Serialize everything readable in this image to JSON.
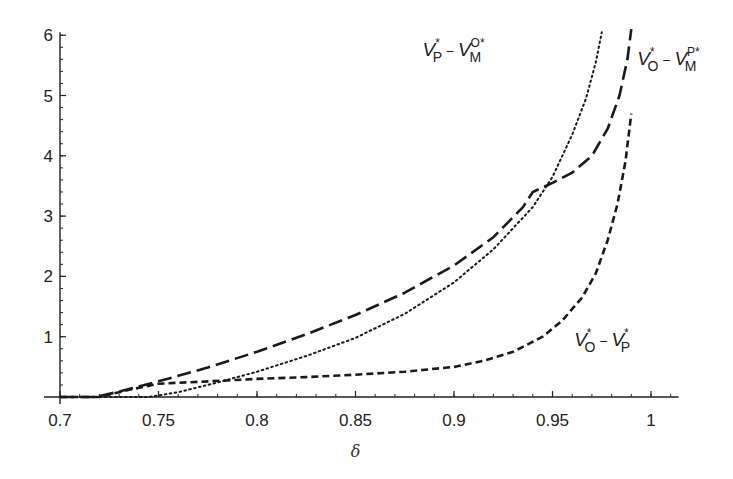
{
  "chart_data": {
    "type": "line",
    "title": "",
    "xlabel": "δ",
    "ylabel": "",
    "xlim": [
      0.7,
      1.014
    ],
    "ylim": [
      0,
      6.05
    ],
    "grid": false,
    "x_ticks": [
      0.7,
      0.75,
      0.8,
      0.85,
      0.9,
      0.95,
      1
    ],
    "x_tick_labels": [
      "0.7",
      "0.75",
      "0.8",
      "0.85",
      "0.9",
      "0.95",
      "1"
    ],
    "y_ticks": [
      1,
      2,
      3,
      4,
      5,
      6
    ],
    "y_tick_labels": [
      "1",
      "2",
      "3",
      "4",
      "5",
      "6"
    ],
    "x_minor_step": 0.01,
    "y_minor_step": 0.2,
    "series": [
      {
        "name": "V_O* − V_M^P*",
        "style": "long-dash",
        "label": {
          "v1": "V",
          "sub1": "O",
          "sup1": "*",
          "minus": "−",
          "v2": "V",
          "sub2": "M",
          "sup2": "P*"
        },
        "label_anchor": [
          0.993,
          5.5
        ],
        "x": [
          0.7,
          0.718,
          0.73,
          0.75,
          0.775,
          0.8,
          0.825,
          0.85,
          0.875,
          0.9,
          0.92,
          0.935,
          0.94,
          0.95,
          0.96,
          0.97,
          0.978,
          0.984,
          0.988,
          0.99
        ],
        "y": [
          0,
          0,
          0.09,
          0.26,
          0.49,
          0.75,
          1.04,
          1.36,
          1.73,
          2.18,
          2.65,
          3.15,
          3.4,
          3.55,
          3.72,
          4.0,
          4.45,
          5.0,
          5.6,
          6.1
        ]
      },
      {
        "name": "V_P* − V_M^O*",
        "style": "dotted",
        "label": {
          "v1": "V",
          "sub1": "P",
          "sup1": "*",
          "minus": "−",
          "v2": "V",
          "sub2": "M",
          "sup2": "O*"
        },
        "label_anchor": [
          0.884,
          5.65
        ],
        "x": [
          0.7,
          0.72,
          0.745,
          0.76,
          0.78,
          0.8,
          0.825,
          0.85,
          0.875,
          0.9,
          0.92,
          0.94,
          0.95,
          0.96,
          0.967,
          0.972,
          0.975
        ],
        "y": [
          0,
          0,
          0,
          0.08,
          0.24,
          0.42,
          0.68,
          0.98,
          1.38,
          1.9,
          2.45,
          3.15,
          3.65,
          4.35,
          4.95,
          5.55,
          6.05
        ]
      },
      {
        "name": "V_O* − V_P*",
        "style": "short-dash",
        "label": {
          "v1": "V",
          "sub1": "O",
          "sup1": "*",
          "minus": "−",
          "v2": "V",
          "sub2": "P",
          "sup2": "*"
        },
        "label_anchor": [
          0.961,
          0.85
        ],
        "x": [
          0.7,
          0.72,
          0.735,
          0.75,
          0.77,
          0.8,
          0.825,
          0.85,
          0.875,
          0.9,
          0.915,
          0.93,
          0.945,
          0.955,
          0.965,
          0.972,
          0.978,
          0.983,
          0.987,
          0.99
        ],
        "y": [
          0,
          0,
          0.12,
          0.22,
          0.25,
          0.3,
          0.33,
          0.37,
          0.42,
          0.5,
          0.6,
          0.75,
          1.0,
          1.27,
          1.65,
          2.05,
          2.6,
          3.2,
          3.9,
          4.7
        ]
      }
    ]
  }
}
